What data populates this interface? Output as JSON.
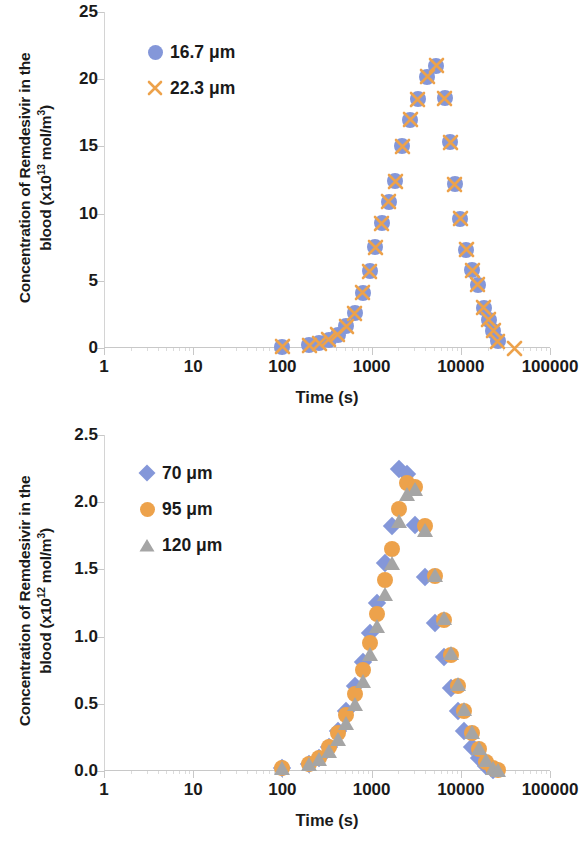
{
  "colors": {
    "blue": "#8497D9",
    "orange": "#EDA24B",
    "gray": "#A5A5A5",
    "axis": "#C8C8C8",
    "text": "#1A1A1A"
  },
  "panels": [
    {
      "id": "top",
      "ytitle_line1": "Concentration of Remdesivir in the",
      "ytitle_line2_pre": "blood (x10",
      "ytitle_exp": "13",
      "ytitle_line2_post": " mol/m",
      "ytitle_unit_exp": "3",
      "ytitle_close": ")",
      "xtitle": "Time (s)",
      "yticks": [
        "0",
        "5",
        "10",
        "15",
        "20",
        "25"
      ],
      "xticks": [
        "1",
        "10",
        "100",
        "1000",
        "10000",
        "100000"
      ],
      "legend": [
        {
          "label": "16.7 μm",
          "marker": "circle",
          "color": "#8497D9"
        },
        {
          "label": "22.3 μm",
          "marker": "cross",
          "color": "#EDA24B"
        }
      ]
    },
    {
      "id": "bottom",
      "ytitle_line1": "Concentration of Remdesivir in the",
      "ytitle_line2_pre": "blood (x10",
      "ytitle_exp": "12",
      "ytitle_line2_post": " mol/m",
      "ytitle_unit_exp": "3",
      "ytitle_close": ")",
      "xtitle": "Time (s)",
      "yticks": [
        "0.0",
        "0.5",
        "1.0",
        "1.5",
        "2.0",
        "2.5"
      ],
      "xticks": [
        "1",
        "10",
        "100",
        "1000",
        "10000",
        "100000"
      ],
      "legend": [
        {
          "label": "70 μm",
          "marker": "diamond",
          "color": "#8497D9"
        },
        {
          "label": "95 μm",
          "marker": "circle",
          "color": "#EDA24B"
        },
        {
          "label": "120 μm",
          "marker": "triangle",
          "color": "#A5A5A5"
        }
      ]
    }
  ],
  "chart_data": [
    {
      "type": "scatter",
      "title": "",
      "xlabel": "Time (s)",
      "ylabel": "Concentration of Remdesivir in the blood (x10^13 mol/m^3)",
      "xscale": "log",
      "xlim": [
        1,
        100000
      ],
      "ylim": [
        0,
        25
      ],
      "yticks": [
        0,
        5,
        10,
        15,
        20,
        25
      ],
      "xticks": [
        1,
        10,
        100,
        1000,
        10000,
        100000
      ],
      "grid": false,
      "legend_position": "upper left inside",
      "series": [
        {
          "name": "16.7 μm",
          "marker": "circle",
          "color": "#8497D9",
          "x": [
            100,
            200,
            260,
            330,
            420,
            520,
            650,
            800,
            950,
            1100,
            1300,
            1550,
            1850,
            2200,
            2700,
            3300,
            4200,
            5300,
            6600,
            7600,
            8600,
            9800,
            11500,
            13500,
            15500,
            18000,
            20500,
            23000,
            26000
          ],
          "y": [
            0.1,
            0.2,
            0.35,
            0.6,
            1.0,
            1.6,
            2.6,
            4.1,
            5.7,
            7.5,
            9.3,
            10.9,
            12.4,
            15.0,
            17.0,
            18.5,
            20.2,
            21.0,
            18.6,
            15.3,
            12.2,
            9.6,
            7.3,
            5.8,
            4.7,
            3.0,
            2.1,
            1.3,
            0.5
          ]
        },
        {
          "name": "22.3 μm",
          "marker": "cross",
          "color": "#EDA24B",
          "x": [
            100,
            200,
            260,
            330,
            420,
            520,
            650,
            800,
            950,
            1100,
            1300,
            1550,
            1850,
            2200,
            2700,
            3300,
            4200,
            5300,
            6600,
            7600,
            8600,
            9800,
            11500,
            13500,
            15500,
            18000,
            20500,
            23000,
            26000,
            40000
          ],
          "y": [
            0.1,
            0.2,
            0.35,
            0.6,
            1.0,
            1.6,
            2.6,
            4.1,
            5.7,
            7.5,
            9.3,
            10.9,
            12.4,
            15.0,
            17.0,
            18.5,
            20.2,
            21.0,
            18.6,
            15.3,
            12.2,
            9.6,
            7.3,
            5.8,
            4.7,
            3.0,
            2.1,
            1.3,
            0.5,
            0.0
          ]
        }
      ]
    },
    {
      "type": "scatter",
      "title": "",
      "xlabel": "Time (s)",
      "ylabel": "Concentration of Remdesivir in the blood (x10^12 mol/m^3)",
      "xscale": "log",
      "xlim": [
        1,
        100000
      ],
      "ylim": [
        0,
        2.5
      ],
      "yticks": [
        0.0,
        0.5,
        1.0,
        1.5,
        2.0,
        2.5
      ],
      "xticks": [
        1,
        10,
        100,
        1000,
        10000,
        100000
      ],
      "grid": false,
      "legend_position": "upper left inside",
      "series": [
        {
          "name": "70 μm",
          "marker": "diamond",
          "color": "#8497D9",
          "x": [
            100,
            200,
            260,
            330,
            420,
            520,
            650,
            800,
            950,
            1150,
            1400,
            1700,
            2050,
            2500,
            3100,
            4000,
            5200,
            6500,
            7800,
            9300,
            11000,
            13500,
            16000,
            19000,
            23000
          ],
          "y": [
            0.02,
            0.05,
            0.1,
            0.18,
            0.3,
            0.45,
            0.63,
            0.81,
            1.03,
            1.25,
            1.55,
            1.82,
            2.25,
            2.21,
            1.83,
            1.44,
            1.1,
            0.85,
            0.62,
            0.45,
            0.3,
            0.18,
            0.1,
            0.04,
            0.01
          ]
        },
        {
          "name": "95 μm",
          "marker": "circle",
          "color": "#EDA24B",
          "x": [
            100,
            200,
            260,
            330,
            420,
            520,
            650,
            800,
            950,
            1150,
            1400,
            1700,
            2050,
            2500,
            3100,
            4000,
            5200,
            6500,
            7800,
            9300,
            11000,
            13500,
            16000,
            19000,
            23000,
            26000
          ],
          "y": [
            0.02,
            0.05,
            0.1,
            0.18,
            0.28,
            0.42,
            0.57,
            0.75,
            0.95,
            1.17,
            1.42,
            1.65,
            1.95,
            2.14,
            2.11,
            1.82,
            1.45,
            1.12,
            0.86,
            0.63,
            0.45,
            0.28,
            0.16,
            0.07,
            0.02,
            0.01
          ]
        },
        {
          "name": "120 μm",
          "marker": "triangle",
          "color": "#A5A5A5",
          "x": [
            100,
            200,
            260,
            330,
            420,
            520,
            650,
            800,
            950,
            1150,
            1400,
            1700,
            2050,
            2500,
            3100,
            4000,
            5200,
            6500,
            7800,
            9300,
            11000,
            13500,
            16000,
            19000,
            23000,
            26000
          ],
          "y": [
            0.02,
            0.05,
            0.09,
            0.15,
            0.24,
            0.36,
            0.5,
            0.67,
            0.87,
            1.08,
            1.32,
            1.55,
            1.86,
            2.06,
            2.1,
            1.79,
            1.46,
            1.14,
            0.88,
            0.65,
            0.46,
            0.29,
            0.17,
            0.08,
            0.02,
            0.01
          ]
        }
      ]
    }
  ]
}
